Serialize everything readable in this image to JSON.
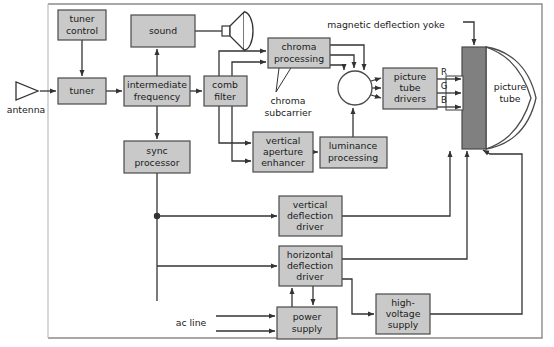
{
  "diagram": {
    "colors": {
      "block_fill": "#c9c9c9",
      "block_stroke": "#4a4a4a",
      "neck_fill": "#808080",
      "line": "#333333",
      "frame": "#8a8a8a",
      "text": "#1a1a1a",
      "page_bg": "#ffffff"
    },
    "blocks": [
      {
        "id": "tuner_control",
        "lines": [
          "tuner",
          "control"
        ],
        "x": 58,
        "y": 10,
        "w": 48,
        "h": 30
      },
      {
        "id": "sound",
        "lines": [
          "sound"
        ],
        "x": 131,
        "y": 15,
        "w": 64,
        "h": 32
      },
      {
        "id": "tuner",
        "lines": [
          "tuner"
        ],
        "x": 58,
        "y": 78,
        "w": 48,
        "h": 26
      },
      {
        "id": "intermediate_frequency",
        "lines": [
          "intermediate",
          "frequency"
        ],
        "x": 124,
        "y": 76,
        "w": 66,
        "h": 30
      },
      {
        "id": "comb_filter",
        "lines": [
          "comb",
          "filter"
        ],
        "x": 204,
        "y": 76,
        "w": 43,
        "h": 30
      },
      {
        "id": "sync_processor",
        "lines": [
          "sync",
          "processor"
        ],
        "x": 124,
        "y": 141,
        "w": 66,
        "h": 32
      },
      {
        "id": "chroma_processing",
        "lines": [
          "chroma",
          "processing"
        ],
        "x": 268,
        "y": 38,
        "w": 62,
        "h": 30
      },
      {
        "id": "vertical_aperture_enhancer",
        "lines": [
          "vertical",
          "aperture",
          "enhancer"
        ],
        "x": 253,
        "y": 132,
        "w": 60,
        "h": 40
      },
      {
        "id": "luminance_processing",
        "lines": [
          "luminance",
          "processing"
        ],
        "x": 320,
        "y": 137,
        "w": 67,
        "h": 31
      },
      {
        "id": "picture_tube_drivers",
        "lines": [
          "picture",
          "tube",
          "drivers"
        ],
        "x": 383,
        "y": 68,
        "w": 54,
        "h": 41
      },
      {
        "id": "vertical_deflection_driver",
        "lines": [
          "vertical",
          "deflection",
          "driver"
        ],
        "x": 279,
        "y": 196,
        "w": 63,
        "h": 40
      },
      {
        "id": "horizontal_deflection_driver",
        "lines": [
          "horizontal",
          "deflection",
          "driver"
        ],
        "x": 279,
        "y": 246,
        "w": 63,
        "h": 40
      },
      {
        "id": "power_supply",
        "lines": [
          "power",
          "supply"
        ],
        "x": 277,
        "y": 307,
        "w": 60,
        "h": 32
      },
      {
        "id": "high_voltage_supply",
        "lines": [
          "high-",
          "voltage",
          "supply"
        ],
        "x": 376,
        "y": 294,
        "w": 54,
        "h": 40
      }
    ],
    "labels": [
      {
        "id": "antenna",
        "text": "antenna",
        "x": 26,
        "y": 110
      },
      {
        "id": "chroma_subcarrier_line1",
        "text": "chroma",
        "x": 286,
        "y": 100
      },
      {
        "id": "chroma_subcarrier_line2",
        "text": "subcarrier",
        "x": 286,
        "y": 112
      },
      {
        "id": "magnetic_deflection_yoke",
        "text": "magnetic deflection yoke",
        "x": 386,
        "y": 25
      },
      {
        "id": "picture_tube",
        "text": "picture",
        "x": 510,
        "y": 87
      },
      {
        "id": "picture_tube_2",
        "text": "tube",
        "x": 510,
        "y": 99
      },
      {
        "id": "ac_line",
        "text": "ac line",
        "x": 191,
        "y": 323
      }
    ],
    "rgb_labels": [
      {
        "id": "r",
        "text": "R",
        "x": 444,
        "y": 73
      },
      {
        "id": "g",
        "text": "G",
        "x": 444,
        "y": 87
      },
      {
        "id": "b",
        "text": "B",
        "x": 444,
        "y": 101
      }
    ],
    "summing_junction": {
      "id": "summing-junction",
      "cx": 355,
      "cy": 88,
      "r": 17
    },
    "crt_neck": {
      "id": "crt-neck",
      "x": 462,
      "y": 47,
      "w": 24,
      "h": 102
    },
    "speaker": {
      "id": "speaker-icon"
    },
    "junction_dots": [
      {
        "id": "sync-branch-dot",
        "cx": 157,
        "cy": 216,
        "r": 3
      }
    ]
  }
}
